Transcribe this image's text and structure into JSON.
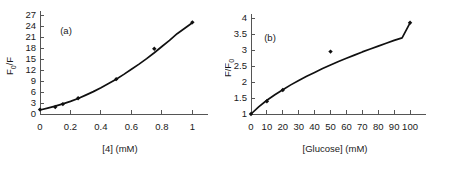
{
  "figure": {
    "background_color": "#ffffff",
    "ink_color": "#101010",
    "axis_color": "#555555"
  },
  "panels": [
    {
      "tag": "(a)",
      "name": "panel-a"
    },
    {
      "tag": "(b)",
      "name": "panel-b"
    }
  ],
  "chart_data": [
    {
      "type": "scatter",
      "title": "(a)",
      "xlabel": "[4] (mM)",
      "ylabel": "F0/F",
      "ylabel_parts": {
        "base": "F",
        "subscript": "0",
        "tail": "/F"
      },
      "xlim": [
        0,
        1.05
      ],
      "ylim": [
        0,
        27
      ],
      "xticks": [
        0,
        0.2,
        0.4,
        0.6,
        0.8,
        1
      ],
      "xticklabels": [
        "0",
        "0.2",
        "0.4",
        "0.6",
        "0.8",
        "1"
      ],
      "yticks": [
        0,
        3,
        6,
        9,
        12,
        15,
        18,
        21,
        24,
        27
      ],
      "yticklabels": [
        "0",
        "3",
        "6",
        "9",
        "12",
        "15",
        "18",
        "21",
        "24",
        "27"
      ],
      "grid": false,
      "legend": false,
      "marker": "filled-diamond",
      "x": [
        0,
        0.1,
        0.15,
        0.25,
        0.5,
        0.75,
        1.0
      ],
      "values": [
        1.2,
        1.9,
        2.7,
        4.3,
        9.5,
        17.8,
        25.0
      ],
      "fit": {
        "description": "upward curving quadratic Stern-Volmer fit",
        "x": [
          0,
          0.05,
          0.1,
          0.15,
          0.2,
          0.25,
          0.3,
          0.35,
          0.4,
          0.45,
          0.5,
          0.55,
          0.6,
          0.65,
          0.7,
          0.75,
          0.8,
          0.85,
          0.9,
          0.95,
          1.0
        ],
        "y": [
          1.1,
          1.6,
          2.15,
          2.75,
          3.45,
          4.25,
          5.15,
          6.1,
          7.15,
          8.3,
          9.5,
          10.8,
          12.2,
          13.6,
          15.1,
          16.7,
          18.4,
          20.1,
          21.9,
          23.4,
          24.9
        ]
      }
    },
    {
      "type": "scatter",
      "title": "(b)",
      "xlabel": "[Glucose] (mM)",
      "ylabel": "F/F0",
      "ylabel_parts": {
        "base": "F/F",
        "subscript": "0",
        "tail": ""
      },
      "xlim": [
        0,
        105
      ],
      "ylim": [
        1,
        4
      ],
      "xticks": [
        0,
        10,
        20,
        30,
        40,
        50,
        60,
        70,
        80,
        90,
        100
      ],
      "xticklabels": [
        "0",
        "10",
        "20",
        "30",
        "40",
        "50",
        "60",
        "70",
        "80",
        "90",
        "100"
      ],
      "yticks": [
        1,
        1.5,
        2,
        2.5,
        3,
        3.5,
        4
      ],
      "yticklabels": [
        "1",
        "1.5",
        "2",
        "2.5",
        "3",
        "3.5",
        "4"
      ],
      "grid": false,
      "legend": false,
      "marker": "filled-diamond",
      "x": [
        0,
        10,
        20,
        50,
        100
      ],
      "values": [
        1.0,
        1.4,
        1.75,
        2.95,
        3.85
      ],
      "fit": {
        "description": "saturating concave binding-isotherm fit",
        "x": [
          0,
          5,
          10,
          15,
          20,
          25,
          30,
          35,
          40,
          45,
          50,
          55,
          60,
          65,
          70,
          75,
          80,
          85,
          90,
          95,
          100
        ],
        "y": [
          1.0,
          1.23,
          1.43,
          1.6,
          1.76,
          1.91,
          2.05,
          2.18,
          2.3,
          2.42,
          2.53,
          2.64,
          2.74,
          2.84,
          2.94,
          3.03,
          3.12,
          3.21,
          3.3,
          3.38,
          3.85
        ]
      }
    }
  ]
}
